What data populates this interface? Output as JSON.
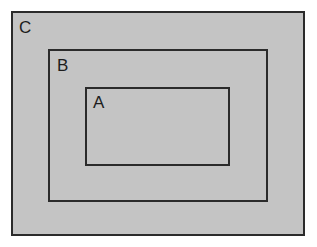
{
  "diagram": {
    "type": "nested-rectangles",
    "background_color": "#ffffff",
    "fill_color": "#c4c4c4",
    "stroke_color": "#2b2b2b",
    "label_color": "#1c1c1c",
    "canvas": {
      "width": 317,
      "height": 247
    },
    "sets": [
      {
        "label": "C",
        "name": "outer-set",
        "nesting_level": 1,
        "rect": {
          "x": 11,
          "y": 11,
          "width": 294,
          "height": 225
        },
        "stroke_width": 2,
        "label_position": {
          "x": 19,
          "y": 21
        }
      },
      {
        "label": "B",
        "name": "middle-set",
        "nesting_level": 2,
        "rect": {
          "x": 48,
          "y": 49,
          "width": 220,
          "height": 153
        },
        "stroke_width": 2,
        "label_position": {
          "x": 57,
          "y": 59
        }
      },
      {
        "label": "A",
        "name": "inner-set",
        "nesting_level": 3,
        "rect": {
          "x": 85,
          "y": 87,
          "width": 145,
          "height": 79
        },
        "stroke_width": 2,
        "label_position": {
          "x": 93,
          "y": 96
        }
      }
    ]
  }
}
